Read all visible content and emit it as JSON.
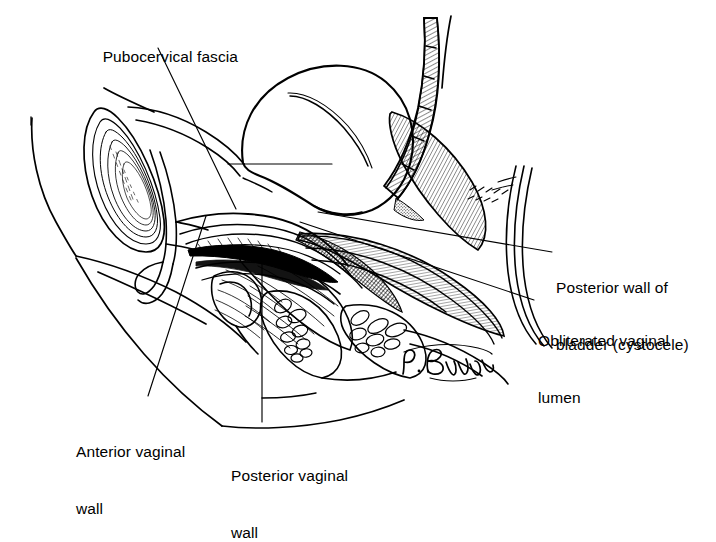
{
  "figure": {
    "type": "medical-line-illustration",
    "background_color": "#ffffff",
    "ink_color": "#000000",
    "signature": "P. Bryan"
  },
  "labels": {
    "pubocervical_fascia": "Pubocervical fascia",
    "posterior_wall_bladder_line1": "Posterior wall of",
    "posterior_wall_bladder_line2": "bladder (cystocele)",
    "obliterated_lumen_line1": "Obliterated vaginal",
    "obliterated_lumen_line2": "lumen",
    "anterior_vaginal_line1": "Anterior vaginal",
    "anterior_vaginal_line2": "wall",
    "posterior_vaginal_line1": "Posterior vaginal",
    "posterior_vaginal_line2": "wall"
  },
  "annotations": {
    "signature_text": "P. Bryan"
  }
}
